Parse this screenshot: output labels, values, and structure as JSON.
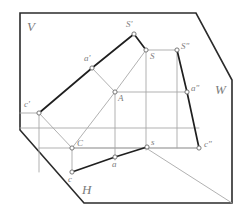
{
  "figure": {
    "colors": {
      "frame": "#2b2b2b",
      "object_dark": "#1a1a1a",
      "projection_gray": "#9a9a9a",
      "construction_gray": "#b4b4b4",
      "label": "#7a7a7a",
      "node_fill": "#ffffff",
      "background": "#ffffff"
    },
    "planes": [
      {
        "id": "V",
        "label": "V",
        "x": 27,
        "y": 20
      },
      {
        "id": "W",
        "label": "W",
        "x": 215,
        "y": 83
      },
      {
        "id": "H",
        "label": "H",
        "x": 82,
        "y": 183
      }
    ],
    "points": [
      {
        "id": "s-front",
        "label": "S'",
        "x": 134,
        "y": 34,
        "lx": 126,
        "ly": 20,
        "marker": true
      },
      {
        "id": "s-axo",
        "label": "S",
        "x": 146,
        "y": 50,
        "lx": 150,
        "ly": 52,
        "marker": true
      },
      {
        "id": "s-side",
        "label": "S\"",
        "x": 177,
        "y": 50,
        "lx": 181,
        "ly": 42,
        "marker": true
      },
      {
        "id": "a-front",
        "label": "a'",
        "x": 92,
        "y": 68,
        "lx": 84,
        "ly": 54,
        "marker": true
      },
      {
        "id": "a-axo",
        "label": "A",
        "x": 115,
        "y": 92,
        "lx": 118,
        "ly": 94,
        "marker": true
      },
      {
        "id": "a-side",
        "label": "a\"",
        "x": 187,
        "y": 92,
        "lx": 191,
        "ly": 84,
        "marker": true
      },
      {
        "id": "c-front",
        "label": "c'",
        "x": 39,
        "y": 113,
        "lx": 24,
        "ly": 100,
        "marker": true
      },
      {
        "id": "c-axo",
        "label": "C",
        "x": 72,
        "y": 148,
        "lx": 77,
        "ly": 139,
        "marker": true
      },
      {
        "id": "c-side",
        "label": "c\"",
        "x": 199,
        "y": 148,
        "lx": 204,
        "ly": 140,
        "marker": true
      },
      {
        "id": "s-horiz",
        "label": "s",
        "x": 147,
        "y": 147,
        "lx": 151,
        "ly": 138,
        "marker": true
      },
      {
        "id": "a-horiz",
        "label": "a",
        "x": 115,
        "y": 157,
        "lx": 112,
        "ly": 160,
        "marker": true
      },
      {
        "id": "c-horiz",
        "label": "c",
        "x": 72,
        "y": 172,
        "lx": 68,
        "ly": 175,
        "marker": true
      }
    ],
    "frame_outline": "20,13 196,13 232,80 232,203 84,203 20,130",
    "edges_dark": [
      {
        "name": "edge-cfront-afront",
        "from": [
          39,
          113
        ],
        "to": [
          92,
          68
        ]
      },
      {
        "name": "edge-afront-sfront",
        "from": [
          92,
          68
        ],
        "to": [
          134,
          34
        ]
      },
      {
        "name": "edge-sfront-saxo",
        "from": [
          134,
          34
        ],
        "to": [
          146,
          50
        ]
      },
      {
        "name": "edge-sside-aside",
        "from": [
          177,
          50
        ],
        "to": [
          187,
          92
        ]
      },
      {
        "name": "edge-aside-cside",
        "from": [
          187,
          92
        ],
        "to": [
          199,
          148
        ]
      },
      {
        "name": "edge-chorz-ahorz",
        "from": [
          72,
          172
        ],
        "to": [
          115,
          157
        ]
      },
      {
        "name": "edge-ahorz-shorz",
        "from": [
          115,
          157
        ],
        "to": [
          147,
          147
        ]
      }
    ],
    "edges_gray": [
      {
        "name": "proj-cfront-caxo",
        "from": [
          39,
          113
        ],
        "to": [
          72,
          148
        ]
      },
      {
        "name": "proj-cfront-vert",
        "from": [
          39,
          113
        ],
        "to": [
          39,
          172
        ]
      },
      {
        "name": "proj-caxo-aaxo",
        "from": [
          72,
          148
        ],
        "to": [
          115,
          92
        ]
      },
      {
        "name": "proj-aaxo-saxo",
        "from": [
          115,
          92
        ],
        "to": [
          146,
          50
        ]
      },
      {
        "name": "proj-afront-aaxo",
        "from": [
          92,
          68
        ],
        "to": [
          115,
          92
        ]
      },
      {
        "name": "proj-aaxo-aside",
        "from": [
          115,
          92
        ],
        "to": [
          187,
          92
        ]
      },
      {
        "name": "proj-saxo-sside",
        "from": [
          146,
          50
        ],
        "to": [
          177,
          50
        ]
      },
      {
        "name": "proj-aaxo-ahorz",
        "from": [
          115,
          92
        ],
        "to": [
          115,
          160
        ]
      },
      {
        "name": "proj-saxo-shorz",
        "from": [
          146,
          50
        ],
        "to": [
          146,
          150
        ]
      },
      {
        "name": "proj-sside-vert",
        "from": [
          177,
          50
        ],
        "to": [
          177,
          148
        ]
      },
      {
        "name": "axis-x-horizontal",
        "from": [
          20,
          128
        ],
        "to": [
          199,
          128
        ]
      },
      {
        "name": "axis-y-horizontal",
        "from": [
          39,
          148
        ],
        "to": [
          199,
          148
        ]
      },
      {
        "name": "proj-caxo-cside",
        "from": [
          72,
          148
        ],
        "to": [
          199,
          148
        ]
      },
      {
        "name": "proj-caxo-chorz",
        "from": [
          72,
          148
        ],
        "to": [
          72,
          172
        ]
      },
      {
        "name": "axis-oy-diagonal",
        "from": [
          146,
          148
        ],
        "to": [
          232,
          203
        ]
      },
      {
        "name": "proj-cfront-hor",
        "from": [
          39,
          113
        ],
        "to": [
          20,
          113
        ]
      }
    ]
  }
}
